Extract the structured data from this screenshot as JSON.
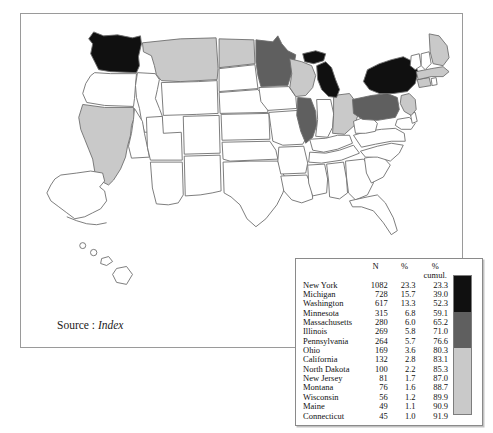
{
  "figure": {
    "source_label": "Source :",
    "source_value": "Index"
  },
  "legend": {
    "headers": {
      "name": "",
      "n": "N",
      "pct": "%",
      "cumul_line1": "%",
      "cumul_line2": "cumul."
    },
    "rows": [
      {
        "state": "New York",
        "code": "NY",
        "n": "1082",
        "pct": "23.3",
        "cumul": "23.3"
      },
      {
        "state": "Michigan",
        "code": "MI",
        "n": "728",
        "pct": "15.7",
        "cumul": "39.0"
      },
      {
        "state": "Washington",
        "code": "WA",
        "n": "617",
        "pct": "13.3",
        "cumul": "52.3"
      },
      {
        "state": "Minnesota",
        "code": "MN",
        "n": "315",
        "pct": "6.8",
        "cumul": "59.1"
      },
      {
        "state": "Massachusetts",
        "code": "MA",
        "n": "280",
        "pct": "6.0",
        "cumul": "65.2"
      },
      {
        "state": "Illinois",
        "code": "IL",
        "n": "269",
        "pct": "5.8",
        "cumul": "71.0"
      },
      {
        "state": "Pennsylvania",
        "code": "PA",
        "n": "264",
        "pct": "5.7",
        "cumul": "76.6"
      },
      {
        "state": "Ohio",
        "code": "OH",
        "n": "169",
        "pct": "3.6",
        "cumul": "80.3"
      },
      {
        "state": "California",
        "code": "CA",
        "n": "132",
        "pct": "2.8",
        "cumul": "83.1"
      },
      {
        "state": "North Dakota",
        "code": "ND",
        "n": "100",
        "pct": "2.2",
        "cumul": "85.3"
      },
      {
        "state": "New Jersey",
        "code": "NJ",
        "n": "81",
        "pct": "1.7",
        "cumul": "87.0"
      },
      {
        "state": "Montana",
        "code": "MT",
        "n": "76",
        "pct": "1.6",
        "cumul": "88.7"
      },
      {
        "state": "Wisconsin",
        "code": "WI",
        "n": "56",
        "pct": "1.2",
        "cumul": "89.9"
      },
      {
        "state": "Maine",
        "code": "ME",
        "n": "49",
        "pct": "1.1",
        "cumul": "90.9"
      },
      {
        "state": "Connecticut",
        "code": "CT",
        "n": "45",
        "pct": "1.0",
        "cumul": "91.9"
      }
    ],
    "ramp": [
      {
        "name": "high",
        "color": "#101010",
        "height_pct": 26
      },
      {
        "name": "medium",
        "color": "#5f5f5f",
        "height_pct": 26
      },
      {
        "name": "low",
        "color": "#c9c9c9",
        "height_pct": 48
      }
    ]
  },
  "chart_data": {
    "type": "map",
    "title": "",
    "subtitle": "",
    "map_region": "United States",
    "value_field": "N",
    "legend_position": "bottom-right",
    "color_classes": [
      {
        "label": "high",
        "color": "#101010"
      },
      {
        "label": "medium",
        "color": "#5f5f5f"
      },
      {
        "label": "low",
        "color": "#c9c9c9"
      },
      {
        "label": "none",
        "color": "#ffffff"
      }
    ],
    "categories": [
      "New York",
      "Michigan",
      "Washington",
      "Minnesota",
      "Massachusetts",
      "Illinois",
      "Pennsylvania",
      "Ohio",
      "California",
      "North Dakota",
      "New Jersey",
      "Montana",
      "Wisconsin",
      "Maine",
      "Connecticut"
    ],
    "values": [
      1082,
      728,
      617,
      315,
      280,
      269,
      264,
      169,
      132,
      100,
      81,
      76,
      56,
      49,
      45
    ],
    "series": [
      {
        "name": "N",
        "values": [
          1082,
          728,
          617,
          315,
          280,
          269,
          264,
          169,
          132,
          100,
          81,
          76,
          56,
          49,
          45
        ]
      },
      {
        "name": "%",
        "values": [
          23.3,
          15.7,
          13.3,
          6.8,
          6.0,
          5.8,
          5.7,
          3.6,
          2.8,
          2.2,
          1.7,
          1.6,
          1.2,
          1.1,
          1.0
        ]
      },
      {
        "name": "% cumul.",
        "values": [
          23.3,
          39.0,
          52.3,
          59.1,
          65.2,
          71.0,
          76.6,
          80.3,
          83.1,
          85.3,
          87.0,
          88.7,
          89.9,
          90.9,
          91.9
        ]
      }
    ],
    "state_fills": {
      "NY": "#101010",
      "MI": "#101010",
      "WA": "#101010",
      "MN": "#5f5f5f",
      "IL": "#5f5f5f",
      "PA": "#5f5f5f",
      "MA": "#c9c9c9",
      "OH": "#c9c9c9",
      "CA": "#c9c9c9",
      "ND": "#c9c9c9",
      "NJ": "#c9c9c9",
      "MT": "#c9c9c9",
      "WI": "#c9c9c9",
      "ME": "#c9c9c9",
      "CT": "#c9c9c9"
    },
    "unshaded_color": "#ffffff"
  }
}
